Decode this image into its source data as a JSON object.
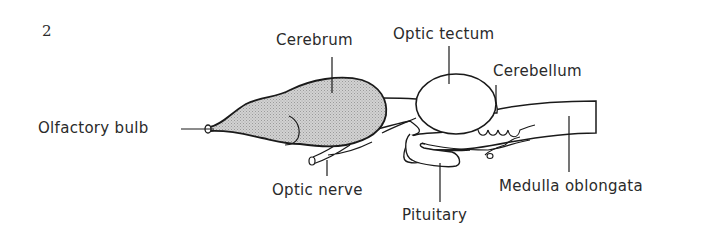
{
  "figure": {
    "number": "2",
    "fill_color": "#c8c8c8",
    "line_color": "#1a1a1a"
  },
  "labels": {
    "olfactory_bulb": "Olfactory bulb",
    "cerebrum": "Cerebrum",
    "optic_tectum": "Optic tectum",
    "cerebellum": "Cerebellum",
    "optic_nerve": "Optic nerve",
    "pituitary": "Pituitary",
    "medulla_oblongata": "Medulla oblongata"
  }
}
